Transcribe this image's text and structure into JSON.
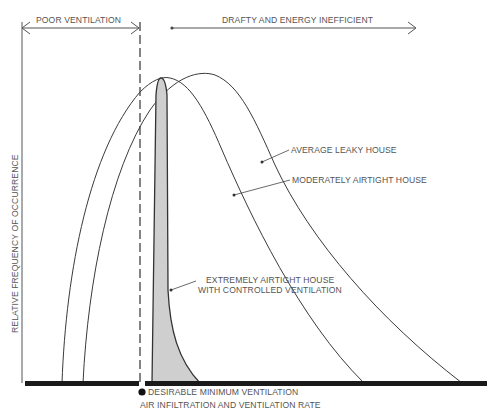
{
  "diagram": {
    "top_ranges": {
      "poor_ventilation": "POOR VENTILATION",
      "drafty": "DRAFTY AND ENERGY INEFFICIENT"
    },
    "y_axis_label": "RELATIVE FREQUENCY OF OCCURRENCE",
    "x_axis_label": "AIR INFILTRATION AND VENTILATION RATE",
    "marker_label": "DESIRABLE MINIMUM VENTILATION",
    "curves": [
      {
        "id": "average-leaky",
        "label": "AVERAGE LEAKY HOUSE"
      },
      {
        "id": "moderately-airtight",
        "label": "MODERATELY AIRTIGHT HOUSE"
      },
      {
        "id": "extremely-airtight",
        "label_line1": "EXTREMELY AIRTIGHT HOUSE",
        "label_line2": "WITH CONTROLLED VENTILATION"
      }
    ],
    "colors": {
      "line": "#3a3a3a",
      "shade": "#cfcfcf",
      "baseline": "#1a1a1a"
    }
  }
}
